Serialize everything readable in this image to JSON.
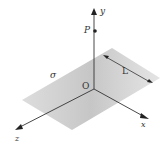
{
  "diagram": {
    "labels": {
      "y_axis": "y",
      "x_axis": "x",
      "z_axis": "z",
      "origin": "O",
      "point": "P",
      "surface": "σ",
      "dimension": "L"
    },
    "colors": {
      "plane": "#c8c8c8",
      "axis": "#333333",
      "background": "#ffffff"
    }
  }
}
